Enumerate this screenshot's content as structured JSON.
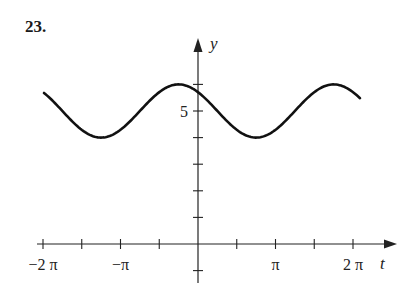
{
  "problem": {
    "number": "23."
  },
  "chart_data": {
    "type": "line",
    "title": "",
    "xlabel": "t",
    "ylabel": "y",
    "xlim": [
      -6.283,
      6.5
    ],
    "ylim": [
      -1,
      7
    ],
    "grid": false,
    "x_ticks": [
      "-2π",
      "-3π/2",
      "-π",
      "-π/2",
      "0",
      "π/2",
      "π",
      "3π/2",
      "2π"
    ],
    "x_tick_labels": [
      "−2 π",
      "−π",
      "π",
      "2 π"
    ],
    "y_ticks": [
      -1,
      1,
      2,
      3,
      4,
      5,
      6
    ],
    "y_tick_labels": [
      "5"
    ],
    "series": [
      {
        "name": "y = 5 + sin(t + 3π/4)",
        "description": "sinusoid with midline 5, amplitude 1, period 2π, maximum near t≈-π/4",
        "x": [
          -6.28,
          -5.5,
          -4.71,
          -3.93,
          -3.14,
          -2.36,
          -1.57,
          -0.79,
          0,
          0.79,
          1.57,
          2.36,
          3.14,
          3.93,
          4.71,
          5.5,
          6.5
        ],
        "values": [
          5.71,
          5.0,
          4.29,
          4.0,
          4.29,
          5.0,
          5.71,
          6.0,
          5.71,
          5.0,
          4.29,
          4.0,
          4.29,
          5.0,
          5.71,
          6.0,
          5.63
        ]
      }
    ]
  }
}
